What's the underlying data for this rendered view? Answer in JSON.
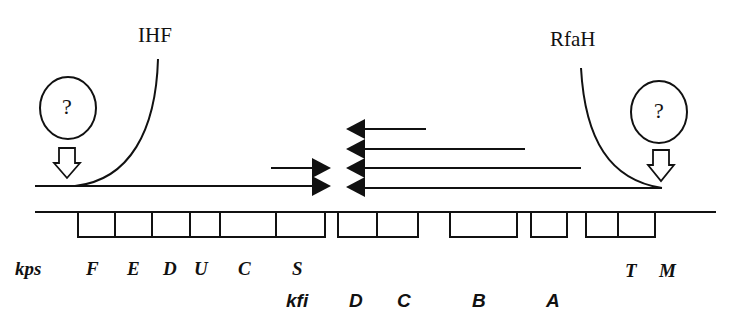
{
  "factors": {
    "left": "IHF",
    "right": "RfaH",
    "unknown_left": "?",
    "unknown_right": "?"
  },
  "operons": {
    "kps": {
      "label": "kps",
      "genes": [
        "F",
        "E",
        "D",
        "U",
        "C",
        "S",
        "T",
        "M"
      ]
    },
    "kfi": {
      "label": "kfi",
      "genes": [
        "D",
        "C",
        "B",
        "A"
      ]
    }
  },
  "colors": {
    "stroke": "#111111",
    "background": "#ffffff"
  }
}
